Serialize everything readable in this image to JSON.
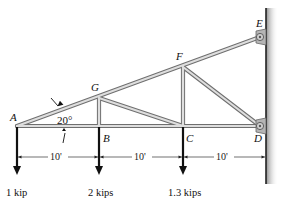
{
  "diagram": {
    "type": "truss",
    "nodes": {
      "A": {
        "label": "A"
      },
      "B": {
        "label": "B"
      },
      "C": {
        "label": "C"
      },
      "D": {
        "label": "D"
      },
      "E": {
        "label": "E"
      },
      "F": {
        "label": "F"
      },
      "G": {
        "label": "G"
      }
    },
    "angle": {
      "label": "20°"
    },
    "dimensions": [
      {
        "label": "10'"
      },
      {
        "label": "10'"
      },
      {
        "label": "10'"
      }
    ],
    "loads": [
      {
        "node": "A",
        "label": "1 kip"
      },
      {
        "node": "B",
        "label": "2 kips"
      },
      {
        "node": "C",
        "label": "1.3 kips"
      }
    ],
    "supports": [
      "E",
      "D"
    ],
    "colors": {
      "member_fill": "#d9d9d9",
      "member_stroke": "#6f6f6f",
      "load_arrow": "#111111",
      "wall_shadow": "#9a9a9a"
    }
  }
}
